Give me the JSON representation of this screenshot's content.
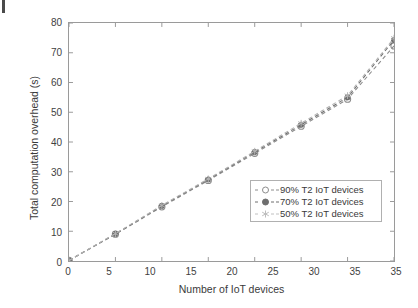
{
  "figure": {
    "artifact": "page-scan-mark"
  },
  "chart_data": {
    "type": "line",
    "title": "",
    "xlabel": "Number of IoT devices",
    "ylabel": "Total computation overhead (s)",
    "xlim": [
      0,
      35
    ],
    "ylim": [
      0,
      80
    ],
    "xticks": [
      0,
      5,
      10,
      15,
      20,
      25,
      30,
      35,
      35
    ],
    "xtick_labels": [
      "0",
      "5",
      "10",
      "15",
      "20",
      "25",
      "30",
      "35",
      "35"
    ],
    "yticks": [
      0,
      10,
      20,
      30,
      40,
      50,
      60,
      70,
      80
    ],
    "ytick_labels": [
      "0",
      "10",
      "20",
      "30",
      "40",
      "50",
      "60",
      "70",
      "80"
    ],
    "grid": false,
    "legend_position": "lower-right",
    "x": [
      0,
      5,
      10,
      15,
      20,
      25,
      30,
      35
    ],
    "series": [
      {
        "name": "90% T2 IoT devices",
        "label": "90% T2 IoT devices",
        "marker": "circle-open",
        "line_style": "dashed",
        "color": "#8c8c8c",
        "values": [
          0.2,
          9.0,
          18.2,
          27.1,
          36.2,
          45.3,
          54.4,
          72.3
        ]
      },
      {
        "name": "70% T2 IoT devices",
        "label": "70% T2 IoT devices",
        "marker": "circle-filled",
        "line_style": "dashed",
        "color": "#6e6e6e",
        "values": [
          0.2,
          9.1,
          18.5,
          27.4,
          36.6,
          45.8,
          55.0,
          74.3
        ]
      },
      {
        "name": "50% T2 IoT devices",
        "label": "50% T2 IoT devices",
        "marker": "star",
        "line_style": "dashed",
        "color": "#b3b3b3",
        "values": [
          0.2,
          9.2,
          18.7,
          27.6,
          36.9,
          46.3,
          55.6,
          74.9
        ]
      }
    ],
    "colors": {
      "axis": "#9a9a9a",
      "text": "#3a3a3a",
      "legend_border": "#b0b0b0",
      "background": "#ffffff"
    }
  }
}
